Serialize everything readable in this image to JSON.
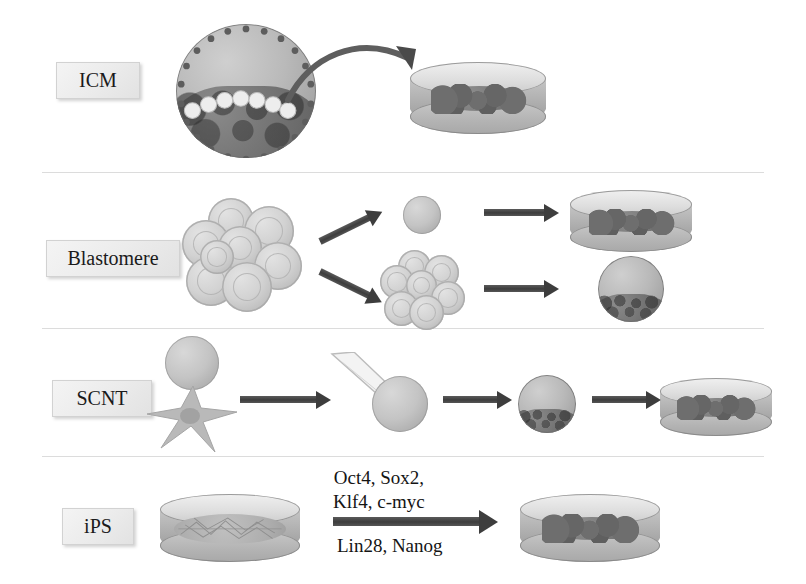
{
  "figure": {
    "background_color": "#ffffff",
    "divider_color": "#dcdcdc"
  },
  "rows": [
    {
      "id": "icm",
      "label": "ICM",
      "description": "Inner cell mass isolated from a blastocyst and plated into a culture dish",
      "elements": [
        {
          "name": "blastocyst",
          "kind": "blastocyst"
        },
        {
          "name": "derivation-arrow",
          "kind": "curved-arrow"
        },
        {
          "name": "culture-dish-colony",
          "kind": "dish-with-colony"
        }
      ]
    },
    {
      "id": "blastomere",
      "label": "Blastomere",
      "description": "A single blastomere biopsied from a morula gives a stem cell colony while the remaining embryo develops to blastocyst",
      "elements": [
        {
          "name": "morula",
          "kind": "morula"
        },
        {
          "name": "branch-arrow-up",
          "kind": "arrow"
        },
        {
          "name": "branch-arrow-down",
          "kind": "arrow"
        },
        {
          "name": "single-blastomere",
          "kind": "cell"
        },
        {
          "name": "residual-embryo",
          "kind": "morula"
        },
        {
          "name": "culture-dish-colony",
          "kind": "dish-with-colony"
        },
        {
          "name": "blastocyst",
          "kind": "blastocyst"
        }
      ]
    },
    {
      "id": "scnt",
      "label": "SCNT",
      "description": "Somatic cell nuclear transfer: a fibroblast nucleus is injected into an enucleated oocyte, which develops to blastocyst and is plated",
      "elements": [
        {
          "name": "oocyte",
          "kind": "cell"
        },
        {
          "name": "fibroblast",
          "kind": "fibroblast"
        },
        {
          "name": "transfer-arrow",
          "kind": "arrow"
        },
        {
          "name": "injection-pipette",
          "kind": "pipette"
        },
        {
          "name": "reconstructed-oocyte",
          "kind": "cell"
        },
        {
          "name": "development-arrow",
          "kind": "arrow"
        },
        {
          "name": "blastocyst",
          "kind": "blastocyst"
        },
        {
          "name": "plating-arrow",
          "kind": "arrow"
        },
        {
          "name": "culture-dish-colony",
          "kind": "dish-with-colony"
        }
      ]
    },
    {
      "id": "ips",
      "label": "iPS",
      "description": "Fibroblasts are reprogrammed by defined factors into induced pluripotent stem cell colonies",
      "elements": [
        {
          "name": "fibroblast-dish",
          "kind": "dish-with-fibroblasts"
        },
        {
          "name": "reprogramming-arrow",
          "kind": "arrow"
        },
        {
          "name": "culture-dish-colony",
          "kind": "dish-with-colony"
        }
      ]
    }
  ],
  "reprogramming_factors": {
    "above_line_1": "Oct4, Sox2,",
    "above_line_2": "Klf4, c-myc",
    "below_line_1": "Lin28, Nanog"
  }
}
